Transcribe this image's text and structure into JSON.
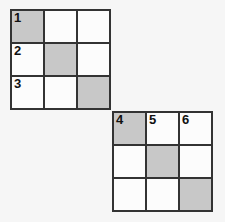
{
  "page": {
    "background_color": "#f6f6f6",
    "width": 225,
    "height": 222
  },
  "style": {
    "shaded_color": "#c8c8c8",
    "unshaded_color": "#fcfcfc",
    "border_color": "#333333"
  },
  "grids": [
    {
      "id": "grid-1",
      "rows": 3,
      "cols": 3,
      "cells": [
        {
          "label": "1",
          "shaded": true
        },
        {
          "label": "",
          "shaded": false
        },
        {
          "label": "",
          "shaded": false
        },
        {
          "label": "2",
          "shaded": false
        },
        {
          "label": "",
          "shaded": true
        },
        {
          "label": "",
          "shaded": false
        },
        {
          "label": "3",
          "shaded": false
        },
        {
          "label": "",
          "shaded": false
        },
        {
          "label": "",
          "shaded": true
        }
      ]
    },
    {
      "id": "grid-2",
      "rows": 3,
      "cols": 3,
      "cells": [
        {
          "label": "4",
          "shaded": true
        },
        {
          "label": "5",
          "shaded": false
        },
        {
          "label": "6",
          "shaded": false
        },
        {
          "label": "",
          "shaded": false
        },
        {
          "label": "",
          "shaded": true
        },
        {
          "label": "",
          "shaded": false
        },
        {
          "label": "",
          "shaded": false
        },
        {
          "label": "",
          "shaded": false
        },
        {
          "label": "",
          "shaded": true
        }
      ]
    }
  ]
}
